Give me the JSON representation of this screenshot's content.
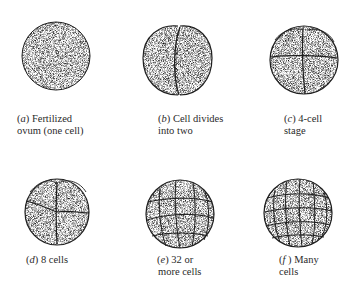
{
  "stages": [
    {
      "letter": "a",
      "line1": "Fertilized",
      "line2": "ovum (one cell)",
      "cells": 1
    },
    {
      "letter": "b",
      "line1": "Cell divides",
      "line2": "into two",
      "cells": 2
    },
    {
      "letter": "c",
      "line1": "4-cell",
      "line2": "stage",
      "cells": 4
    },
    {
      "letter": "d",
      "line1": "8 cells",
      "line2": "",
      "cells": 8
    },
    {
      "letter": "e",
      "line1": "32 or",
      "line2": "more cells",
      "cells": 32
    },
    {
      "letter": "f",
      "line1": "Many",
      "line2": "cells",
      "cells": 64
    }
  ],
  "colors": {
    "ink": "#1e1e1e",
    "shade": "#8a8a8a",
    "paper": "#ffffff"
  }
}
